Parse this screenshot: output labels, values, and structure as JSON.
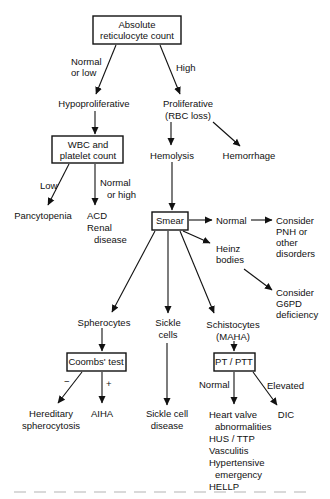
{
  "diagram": {
    "nodes": {
      "root": [
        "Absolute",
        "reticulocyte count"
      ],
      "hypo": [
        "Hypoproliferative"
      ],
      "prolif": [
        "Proliferative",
        "(RBC loss)"
      ],
      "wbc": [
        "WBC and",
        "platelet count"
      ],
      "hemolysis": [
        "Hemolysis"
      ],
      "hemorrhage": [
        "Hemorrhage"
      ],
      "pancytopenia": [
        "Pancytopenia"
      ],
      "acd": [
        "ACD",
        "Renal",
        "disease"
      ],
      "smear": [
        "Smear"
      ],
      "smear_normal": [
        "Normal"
      ],
      "pnh": [
        "Consider",
        "PNH or",
        "other",
        "disorders"
      ],
      "heinz": [
        "Heinz",
        "bodies"
      ],
      "g6pd": [
        "Consider",
        "G6PD",
        "deficiency"
      ],
      "spherocytes": [
        "Spherocytes"
      ],
      "sickle": [
        "Sickle",
        "cells"
      ],
      "schisto": [
        "Schistocytes",
        "(MAHA)"
      ],
      "coombs": [
        "Coombs' test"
      ],
      "ptptt": [
        "PT / PTT"
      ],
      "hered": [
        "Hereditary",
        "spherocytosis"
      ],
      "aiha": [
        "AIHA"
      ],
      "scd": [
        "Sickle cell",
        "disease"
      ],
      "mahacauses": [
        "Heart valve",
        "abnormalities",
        "HUS / TTP",
        "Vasculitis",
        "Hypertensive",
        "emergency",
        "HELLP"
      ],
      "dic": [
        "DIC"
      ]
    },
    "edge_labels": {
      "normal_or_low": [
        "Normal",
        "or low"
      ],
      "high": [
        "High"
      ],
      "low": [
        "Low"
      ],
      "normal_or_high": [
        "Normal",
        "or high"
      ],
      "minus": [
        "−"
      ],
      "plus": [
        "+"
      ],
      "pt_normal": [
        "Normal"
      ],
      "pt_elevated": [
        "Elevated"
      ]
    }
  }
}
